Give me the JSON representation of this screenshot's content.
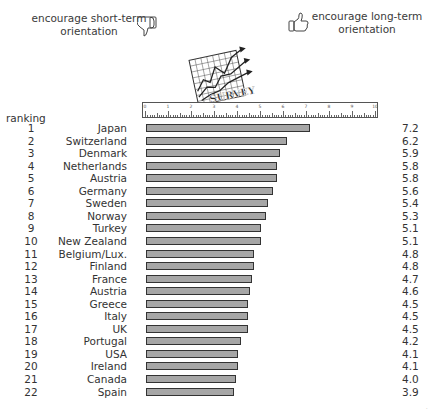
{
  "header": {
    "left_label_line1": "encourage short-term",
    "left_label_line2": "orientation",
    "right_label_line1": "encourage long-term",
    "right_label_line2": "orientation",
    "left_icon": "thumbs-down-icon",
    "right_icon": "thumbs-up-icon",
    "graphic_text": "SURVEY"
  },
  "ruler": {
    "ticks": [
      "0",
      "1",
      "2",
      "3",
      "4",
      "5",
      "6",
      "7",
      "8",
      "9",
      "10"
    ]
  },
  "ranking_label": "ranking",
  "chart_data": {
    "type": "bar",
    "orientation": "horizontal",
    "title": "",
    "left_annotation": "encourage short-term orientation",
    "right_annotation": "encourage long-term orientation",
    "xlabel": "",
    "ylabel": "ranking",
    "xlim": [
      0,
      10
    ],
    "x_ticks": [
      0,
      1,
      2,
      3,
      4,
      5,
      6,
      7,
      8,
      9,
      10
    ],
    "grid": false,
    "legend": null,
    "categories": [
      "Japan",
      "Switzerland",
      "Denmark",
      "Netherlands",
      "Austria",
      "Germany",
      "Sweden",
      "Norway",
      "Turkey",
      "New Zealand",
      "Belgium/Lux.",
      "Finland",
      "France",
      "Austria",
      "Greece",
      "Italy",
      "UK",
      "Portugal",
      "USA",
      "Ireland",
      "Canada",
      "Spain"
    ],
    "ranks": [
      1,
      2,
      3,
      4,
      5,
      6,
      7,
      8,
      9,
      10,
      11,
      12,
      13,
      14,
      15,
      16,
      17,
      18,
      19,
      20,
      21,
      22
    ],
    "values": [
      7.2,
      6.2,
      5.9,
      5.8,
      5.8,
      5.6,
      5.4,
      5.3,
      5.1,
      5.1,
      4.8,
      4.8,
      4.7,
      4.6,
      4.5,
      4.5,
      4.5,
      4.2,
      4.1,
      4.1,
      4.0,
      3.9
    ],
    "value_labels": [
      "7.2",
      "6.2",
      "5.9",
      "5.8",
      "5.8",
      "5.6",
      "5.4",
      "5.3",
      "5.1",
      "5.1",
      "4.8",
      "4.8",
      "4.7",
      "4.6",
      "4.5",
      "4.5",
      "4.5",
      "4.2",
      "4.1",
      "4.1",
      "4.0",
      "3.9"
    ]
  },
  "rows": [
    {
      "rank": "1",
      "country": "Japan",
      "value": "7.2",
      "bar": 7.2
    },
    {
      "rank": "2",
      "country": "Switzerland",
      "value": "6.2",
      "bar": 6.2
    },
    {
      "rank": "3",
      "country": "Denmark",
      "value": "5.9",
      "bar": 5.9
    },
    {
      "rank": "4",
      "country": "Netherlands",
      "value": "5.8",
      "bar": 5.8
    },
    {
      "rank": "5",
      "country": "Austria",
      "value": "5.8",
      "bar": 5.8
    },
    {
      "rank": "6",
      "country": "Germany",
      "value": "5.6",
      "bar": 5.6
    },
    {
      "rank": "7",
      "country": "Sweden",
      "value": "5.4",
      "bar": 5.4
    },
    {
      "rank": "8",
      "country": "Norway",
      "value": "5.3",
      "bar": 5.3
    },
    {
      "rank": "9",
      "country": "Turkey",
      "value": "5.1",
      "bar": 5.1
    },
    {
      "rank": "10",
      "country": "New Zealand",
      "value": "5.1",
      "bar": 5.1
    },
    {
      "rank": "11",
      "country": "Belgium/Lux.",
      "value": "4.8",
      "bar": 4.8
    },
    {
      "rank": "12",
      "country": "Finland",
      "value": "4.8",
      "bar": 4.8
    },
    {
      "rank": "13",
      "country": "France",
      "value": "4.7",
      "bar": 4.7
    },
    {
      "rank": "14",
      "country": "Austria",
      "value": "4.6",
      "bar": 4.6
    },
    {
      "rank": "15",
      "country": "Greece",
      "value": "4.5",
      "bar": 4.5
    },
    {
      "rank": "16",
      "country": "Italy",
      "value": "4.5",
      "bar": 4.5
    },
    {
      "rank": "17",
      "country": "UK",
      "value": "4.5",
      "bar": 4.5
    },
    {
      "rank": "18",
      "country": "Portugal",
      "value": "4.2",
      "bar": 4.2
    },
    {
      "rank": "19",
      "country": "USA",
      "value": "4.1",
      "bar": 4.1
    },
    {
      "rank": "20",
      "country": "Ireland",
      "value": "4.1",
      "bar": 4.1
    },
    {
      "rank": "21",
      "country": "Canada",
      "value": "4.0",
      "bar": 4.0
    },
    {
      "rank": "22",
      "country": "Spain",
      "value": "3.9",
      "bar": 3.9
    }
  ]
}
